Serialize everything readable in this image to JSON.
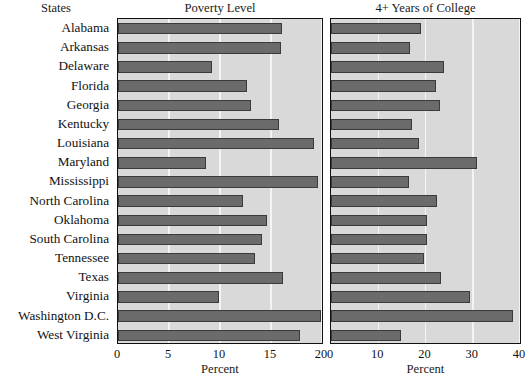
{
  "row_header": "States",
  "chart_data": {
    "type": "bar",
    "orientation": "horizontal",
    "title": "",
    "grid": true,
    "legend": false,
    "categories": [
      "Alabama",
      "Arkansas",
      "Delaware",
      "Florida",
      "Georgia",
      "Kentucky",
      "Louisiana",
      "Maryland",
      "Mississippi",
      "North Carolina",
      "Oklahoma",
      "South Carolina",
      "Tennessee",
      "Texas",
      "Virginia",
      "Washington D.C.",
      "West Virginia"
    ],
    "panels": [
      {
        "title": "Poverty Level",
        "xlabel": "Percent",
        "xlim": [
          0,
          20
        ],
        "xticks": [
          0,
          5,
          10,
          15,
          20
        ],
        "xticklabels": [
          "0",
          "5",
          "10",
          "15",
          "20"
        ],
        "values": [
          16.1,
          16.0,
          9.2,
          12.6,
          13.0,
          15.8,
          19.2,
          8.6,
          19.6,
          12.3,
          14.6,
          14.1,
          13.4,
          16.2,
          9.9,
          19.9,
          17.8
        ]
      },
      {
        "title": "4+ Years of College",
        "xlabel": "Percent",
        "xlim": [
          0,
          40
        ],
        "xticks": [
          0,
          10,
          20,
          30,
          40
        ],
        "xticklabels": [
          "0",
          "10",
          "20",
          "30",
          "40"
        ],
        "values": [
          19.0,
          16.7,
          24.0,
          22.3,
          23.1,
          17.1,
          18.7,
          30.8,
          16.5,
          22.5,
          20.3,
          20.4,
          19.6,
          23.2,
          29.5,
          38.5,
          14.8
        ]
      }
    ]
  },
  "style": {
    "bar_fill": "#6b6b6b",
    "bar_stroke": "#3a3a3a",
    "panel_background": "#d9d9d9",
    "gridline_color": "#f4f4f4",
    "border_color": "#111111",
    "text_color": "#111111"
  }
}
